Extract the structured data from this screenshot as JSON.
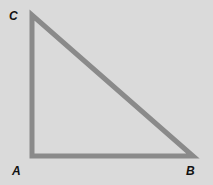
{
  "diagram": {
    "type": "right-triangle",
    "vertices": {
      "A": {
        "label": "A",
        "x": 32,
        "y": 156
      },
      "B": {
        "label": "B",
        "x": 193,
        "y": 156
      },
      "C": {
        "label": "C",
        "x": 32,
        "y": 15
      }
    },
    "right_angle_at": "A",
    "colors": {
      "background": "#dadada",
      "stroke": "#8a8a8a",
      "label": "#111111"
    }
  }
}
